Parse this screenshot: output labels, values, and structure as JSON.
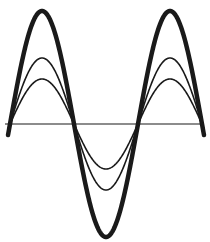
{
  "figure": {
    "background": "#ffffff",
    "stroke_color": "#1a1a1a",
    "axis": {
      "y": 124,
      "x_start": 5,
      "x_end": 200,
      "width": 1.2
    },
    "x_start": 8,
    "x_end": 204,
    "period_px": 128,
    "phase_zero_x": 10,
    "curves": [
      {
        "name": "large-amplitude-wave",
        "amplitude_px": 113,
        "stroke_width": 4.5
      },
      {
        "name": "medium-amplitude-wave",
        "amplitude_px": 66,
        "stroke_width": 1.6
      },
      {
        "name": "small-amplitude-wave",
        "amplitude_px": 45,
        "stroke_width": 1.6
      }
    ]
  }
}
